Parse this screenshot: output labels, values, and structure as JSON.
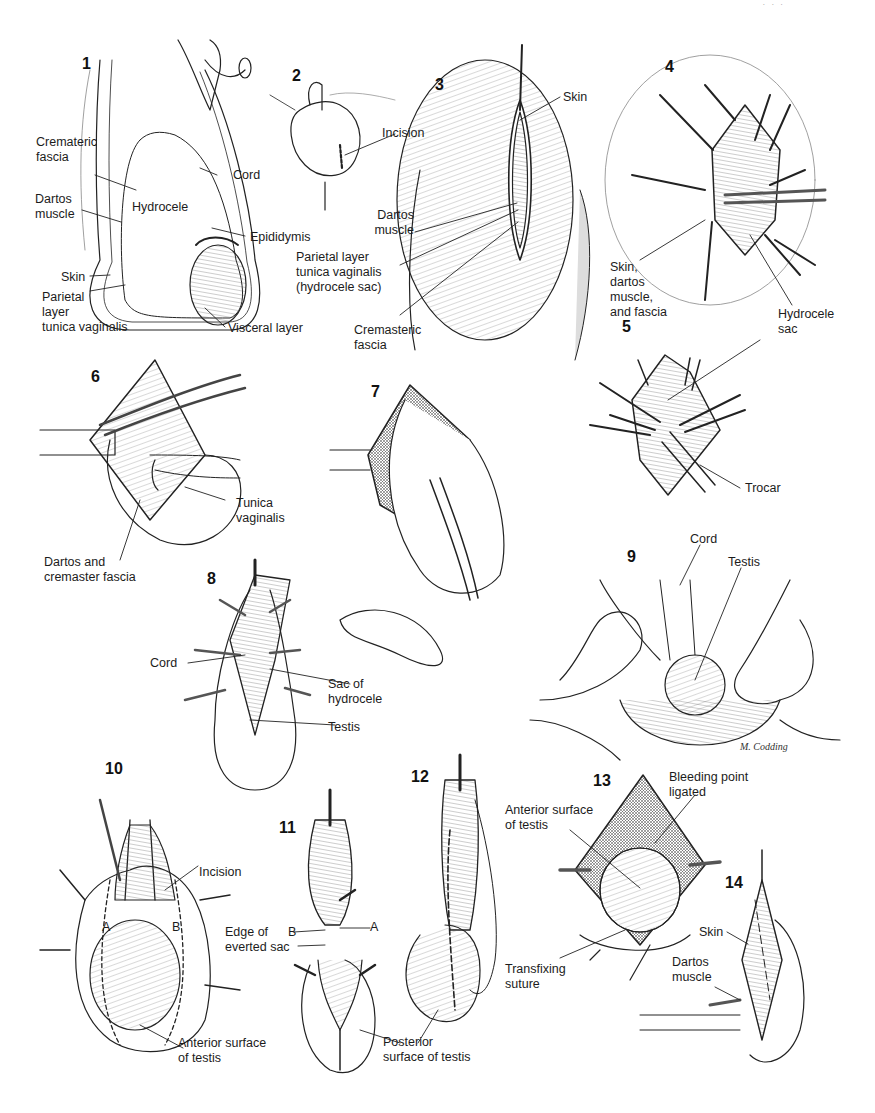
{
  "page": {
    "header_fragment": "· · ·",
    "illustrator_signature": "M. Codding"
  },
  "figures": [
    {
      "number": "1",
      "labels": {
        "crematic_fascia": "Cremateric\nfascia",
        "cord": "Cord",
        "dartos_muscle": "Dartos\nmuscle",
        "hydrocele": "Hydrocele",
        "epididymis": "Epididymis",
        "skin": "Skin",
        "parietal_layer": "Parietal\nlayer\ntunica vaginalis",
        "visceral_layer": "Visceral layer"
      }
    },
    {
      "number": "2",
      "labels": {
        "incision": "Incision"
      }
    },
    {
      "number": "3",
      "labels": {
        "skin": "Skin",
        "dartos_muscle": "Dartos\nmuscle",
        "parietal_layer": "Parietal layer\ntunica vaginalis\n(hydrocele sac)",
        "cremasteric_fascia": "Cremasteric\nfascia"
      }
    },
    {
      "number": "4",
      "labels": {
        "skin_dartos_fascia": "Skin,\ndartos\nmuscle,\nand fascia",
        "hydrocele_sac": "Hydrocele\nsac"
      }
    },
    {
      "number": "5",
      "labels": {
        "trocar": "Trocar"
      }
    },
    {
      "number": "6",
      "labels": {
        "tunica_vaginalis": "Tunica\nvaginalis",
        "dartos_cremaster": "Dartos and\ncremaster fascia"
      }
    },
    {
      "number": "7",
      "labels": {}
    },
    {
      "number": "8",
      "labels": {
        "cord": "Cord",
        "sac_of_hydrocele": "Sac of\nhydrocele",
        "testis": "Testis"
      }
    },
    {
      "number": "9",
      "labels": {
        "cord": "Cord",
        "testis": "Testis"
      }
    },
    {
      "number": "10",
      "labels": {
        "incision": "Incision",
        "a": "A",
        "b": "B",
        "anterior_surface": "Anterior surface\nof testis"
      }
    },
    {
      "number": "11",
      "labels": {
        "edge_everted_sac": "Edge of\neverted sac",
        "b": "B",
        "a": "A"
      }
    },
    {
      "number": "12",
      "labels": {
        "posterior_surface": "Posterior\nsurface of testis"
      }
    },
    {
      "number": "13",
      "labels": {
        "bleeding_point": "Bleeding point\nligated",
        "anterior_surface": "Anterior surface\nof testis",
        "transfixing_suture": "Transfixing\nsuture"
      }
    },
    {
      "number": "14",
      "labels": {
        "skin": "Skin",
        "dartos_muscle": "Dartos\nmuscle"
      }
    }
  ]
}
